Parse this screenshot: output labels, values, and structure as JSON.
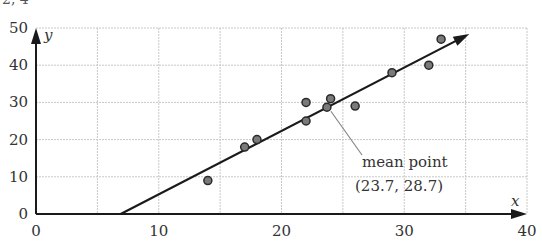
{
  "cutoff_text": "2, 4",
  "chart_data": {
    "type": "scatter",
    "title": "",
    "xlabel": "x",
    "ylabel": "y",
    "xlim": [
      0,
      40
    ],
    "ylim": [
      0,
      50
    ],
    "x_ticks": [
      0,
      10,
      20,
      30,
      40
    ],
    "y_ticks": [
      0,
      10,
      20,
      30,
      40,
      50
    ],
    "grid": {
      "on": true,
      "x_step": 5,
      "y_step": 10,
      "style": "dotted"
    },
    "series": [
      {
        "name": "data points",
        "points": [
          {
            "x": 14,
            "y": 9
          },
          {
            "x": 17,
            "y": 18
          },
          {
            "x": 18,
            "y": 20
          },
          {
            "x": 22,
            "y": 25
          },
          {
            "x": 22,
            "y": 30
          },
          {
            "x": 23.7,
            "y": 28.7
          },
          {
            "x": 24,
            "y": 31
          },
          {
            "x": 26,
            "y": 29
          },
          {
            "x": 29,
            "y": 38
          },
          {
            "x": 32,
            "y": 40
          },
          {
            "x": 33,
            "y": 47
          }
        ]
      }
    ],
    "line_of_best_fit": {
      "start": {
        "x": 6.9,
        "y": 0
      },
      "end": {
        "x": 35.3,
        "y": 48.4
      },
      "arrow": true
    },
    "annotation": {
      "label_line1": "mean point",
      "label_line2": "(23.7, 28.7)",
      "target": {
        "x": 23.7,
        "y": 28.7
      }
    },
    "legend": null
  }
}
